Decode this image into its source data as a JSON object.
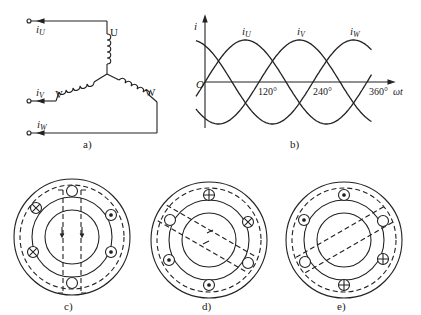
{
  "panels": {
    "a": {
      "caption": "a)",
      "terminals": [
        {
          "current_label": "i",
          "sub": "U",
          "winding": "U"
        },
        {
          "current_label": "i",
          "sub": "V",
          "winding": "V"
        },
        {
          "current_label": "i",
          "sub": "W",
          "winding": "W"
        }
      ]
    },
    "b": {
      "caption": "b)",
      "y_axis_label": "i",
      "x_axis_label": "ωt",
      "origin_label": "O",
      "series_labels": [
        {
          "label": "i",
          "sub": "U"
        },
        {
          "label": "i",
          "sub": "V"
        },
        {
          "label": "i",
          "sub": "W"
        }
      ],
      "ticks": [
        "120°",
        "240°",
        "360°"
      ]
    },
    "c": {
      "caption": "c)"
    },
    "d": {
      "caption": "d)"
    },
    "e": {
      "caption": "e)"
    }
  },
  "chart_data": {
    "type": "line",
    "xlabel": "ωt",
    "ylabel": "i",
    "x_ticks": [
      120,
      240,
      360
    ],
    "x_tick_labels": [
      "120°",
      "240°",
      "360°"
    ],
    "xlim": [
      0,
      360
    ],
    "series": [
      {
        "name": "iU",
        "phase_deg": 0,
        "peak_at_deg": 90
      },
      {
        "name": "iV",
        "phase_deg": -120,
        "peak_at_deg": 210
      },
      {
        "name": "iW",
        "phase_deg": -240,
        "peak_at_deg": 330
      }
    ],
    "grid": false
  }
}
